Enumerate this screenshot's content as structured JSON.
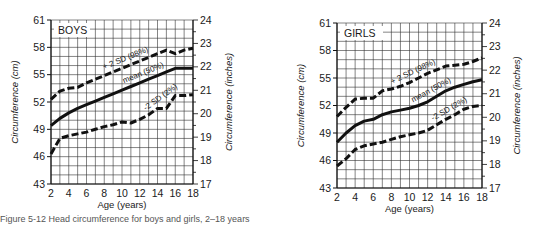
{
  "caption": "Figure 5-12  Head circumference for boys and girls, 2–18 years",
  "chart_data": [
    {
      "type": "line",
      "title": "BOYS",
      "xlabel": "Age (years)",
      "ylabel": "Circumference (cm)",
      "ylabel_right": "Circumference (inches)",
      "xlim": [
        2,
        18
      ],
      "ylim": [
        43,
        61
      ],
      "ylim_right": [
        17,
        24
      ],
      "xticks": [
        2,
        4,
        6,
        8,
        10,
        12,
        14,
        16,
        18
      ],
      "yticks": [
        43,
        46,
        49,
        52,
        55,
        58,
        61
      ],
      "yticks_right": [
        17,
        18,
        19,
        20,
        21,
        22,
        23,
        24
      ],
      "grid": true,
      "x": [
        2,
        3,
        4,
        5,
        6,
        7,
        8,
        9,
        10,
        11,
        12,
        13,
        14,
        15,
        16,
        17,
        18
      ],
      "series": [
        {
          "name": "+ 2 SD (98%)",
          "style": "dashed",
          "values": [
            52.3,
            53.2,
            53.5,
            53.6,
            54.1,
            54.5,
            54.9,
            55.3,
            55.7,
            56.1,
            56.5,
            56.9,
            57.3,
            57.7,
            57.3,
            57.7,
            57.9
          ]
        },
        {
          "name": "mean (50%)",
          "style": "solid",
          "values": [
            49.4,
            50.2,
            50.8,
            51.3,
            51.7,
            52.1,
            52.5,
            52.9,
            53.3,
            53.7,
            54.1,
            54.5,
            54.9,
            55.3,
            55.7,
            55.7,
            55.7
          ]
        },
        {
          "name": "-2 SD (2%)",
          "style": "dashed",
          "values": [
            46.3,
            48.0,
            48.3,
            48.5,
            48.7,
            49.0,
            49.3,
            49.5,
            49.8,
            49.7,
            50.1,
            50.6,
            51.3,
            51.3,
            52.7,
            52.7,
            52.8
          ]
        }
      ]
    },
    {
      "type": "line",
      "title": "GIRLS",
      "xlabel": "Age (years)",
      "ylabel": "Circumference (cm)",
      "ylabel_right": "Circumference (inches)",
      "xlim": [
        2,
        18
      ],
      "ylim": [
        43,
        61
      ],
      "ylim_right": [
        17,
        24
      ],
      "xticks": [
        2,
        4,
        6,
        8,
        10,
        12,
        14,
        16,
        18
      ],
      "yticks": [
        43,
        46,
        49,
        52,
        55,
        58,
        61
      ],
      "yticks_right": [
        17,
        18,
        19,
        20,
        21,
        22,
        23,
        24
      ],
      "grid": true,
      "x": [
        2,
        3,
        4,
        5,
        6,
        7,
        8,
        9,
        10,
        11,
        12,
        13,
        14,
        15,
        16,
        17,
        18
      ],
      "series": [
        {
          "name": "+ 2 SD (98%)",
          "style": "dashed",
          "values": [
            50.8,
            51.8,
            52.7,
            52.8,
            52.8,
            53.6,
            53.8,
            54.1,
            54.5,
            55.0,
            55.5,
            55.9,
            56.3,
            56.4,
            56.5,
            56.8,
            57.2
          ]
        },
        {
          "name": "mean (50%)",
          "style": "solid",
          "values": [
            48.0,
            49.0,
            49.8,
            50.3,
            50.5,
            51.0,
            51.3,
            51.5,
            51.7,
            52.0,
            52.4,
            53.0,
            53.6,
            54.0,
            54.3,
            54.6,
            54.8
          ]
        },
        {
          "name": "-2 SD (2%)",
          "style": "dashed",
          "values": [
            45.4,
            46.2,
            47.2,
            47.6,
            47.8,
            48.0,
            48.3,
            48.6,
            48.8,
            49.0,
            49.3,
            49.9,
            50.5,
            51.0,
            51.6,
            51.9,
            52.0
          ]
        }
      ]
    }
  ]
}
